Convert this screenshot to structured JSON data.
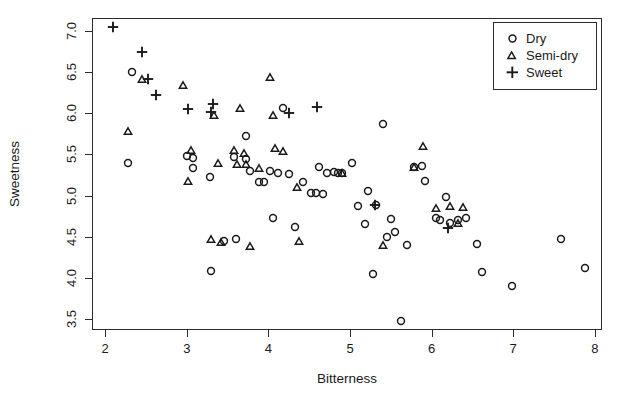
{
  "chart_data": {
    "type": "scatter",
    "title": "",
    "xlabel": "Bitterness",
    "ylabel": "Sweetness",
    "xlim": [
      1.85,
      8.1
    ],
    "ylim": [
      3.35,
      7.15
    ],
    "xticks": [
      2,
      3,
      4,
      5,
      6,
      7,
      8
    ],
    "xtick_labels": [
      "2",
      "3",
      "4",
      "5",
      "6",
      "7",
      "8"
    ],
    "yticks": [
      3.5,
      4.0,
      4.5,
      5.0,
      5.5,
      6.0,
      6.5,
      7.0
    ],
    "ytick_labels": [
      "3.5",
      "4.0",
      "4.5",
      "5.0",
      "5.5",
      "6.0",
      "6.5",
      "7.0"
    ],
    "grid": false,
    "legend_position": "top-right",
    "marker_color": "#1a1a1a",
    "series": [
      {
        "name": "Dry",
        "marker": "circle",
        "points": [
          [
            2.33,
            6.5
          ],
          [
            2.28,
            5.4
          ],
          [
            3.0,
            5.48
          ],
          [
            3.08,
            5.46
          ],
          [
            3.08,
            5.33
          ],
          [
            3.28,
            5.23
          ],
          [
            3.3,
            4.08
          ],
          [
            3.58,
            5.47
          ],
          [
            3.72,
            5.73
          ],
          [
            3.72,
            5.44
          ],
          [
            3.78,
            5.3
          ],
          [
            3.88,
            5.17
          ],
          [
            3.95,
            5.17
          ],
          [
            4.02,
            5.3
          ],
          [
            4.05,
            4.73
          ],
          [
            4.12,
            5.28
          ],
          [
            4.18,
            6.07
          ],
          [
            4.25,
            5.26
          ],
          [
            4.33,
            4.62
          ],
          [
            4.42,
            5.17
          ],
          [
            4.52,
            5.03
          ],
          [
            4.58,
            5.03
          ],
          [
            4.62,
            5.35
          ],
          [
            4.67,
            5.02
          ],
          [
            4.72,
            5.28
          ],
          [
            4.8,
            5.29
          ],
          [
            4.85,
            5.28
          ],
          [
            4.9,
            5.27
          ],
          [
            5.02,
            5.4
          ],
          [
            5.1,
            4.87
          ],
          [
            5.18,
            4.65
          ],
          [
            5.22,
            5.05
          ],
          [
            5.28,
            4.04
          ],
          [
            5.32,
            4.88
          ],
          [
            5.4,
            5.87
          ],
          [
            5.45,
            4.5
          ],
          [
            5.5,
            4.72
          ],
          [
            5.55,
            4.56
          ],
          [
            5.62,
            3.47
          ],
          [
            5.7,
            4.4
          ],
          [
            5.78,
            5.35
          ],
          [
            5.88,
            5.36
          ],
          [
            5.92,
            5.18
          ],
          [
            6.05,
            4.73
          ],
          [
            6.1,
            4.7
          ],
          [
            6.17,
            4.98
          ],
          [
            6.22,
            4.67
          ],
          [
            6.32,
            4.7
          ],
          [
            6.42,
            4.73
          ],
          [
            6.55,
            4.41
          ],
          [
            6.62,
            4.07
          ],
          [
            6.98,
            3.9
          ],
          [
            7.58,
            4.47
          ],
          [
            7.88,
            4.12
          ],
          [
            3.45,
            4.45
          ],
          [
            3.6,
            4.47
          ]
        ]
      },
      {
        "name": "Semi-dry",
        "marker": "triangle",
        "points": [
          [
            2.45,
            6.42
          ],
          [
            2.28,
            5.79
          ],
          [
            2.95,
            6.35
          ],
          [
            3.02,
            5.18
          ],
          [
            3.05,
            5.55
          ],
          [
            3.3,
            4.47
          ],
          [
            3.33,
            5.98
          ],
          [
            3.38,
            5.4
          ],
          [
            3.42,
            4.44
          ],
          [
            3.58,
            5.55
          ],
          [
            3.62,
            5.38
          ],
          [
            3.65,
            6.07
          ],
          [
            3.7,
            5.52
          ],
          [
            3.72,
            5.38
          ],
          [
            3.78,
            4.38
          ],
          [
            3.88,
            5.33
          ],
          [
            4.02,
            6.44
          ],
          [
            4.05,
            5.98
          ],
          [
            4.08,
            5.58
          ],
          [
            4.18,
            5.54
          ],
          [
            4.35,
            5.1
          ],
          [
            4.38,
            4.45
          ],
          [
            4.9,
            5.28
          ],
          [
            5.4,
            4.4
          ],
          [
            5.9,
            5.6
          ],
          [
            6.05,
            4.85
          ],
          [
            6.22,
            4.87
          ],
          [
            6.38,
            4.86
          ],
          [
            6.32,
            4.66
          ],
          [
            5.78,
            5.35
          ]
        ]
      },
      {
        "name": "Sweet",
        "marker": "plus",
        "points": [
          [
            2.1,
            7.05
          ],
          [
            2.45,
            6.75
          ],
          [
            2.52,
            6.42
          ],
          [
            2.62,
            6.22
          ],
          [
            3.02,
            6.05
          ],
          [
            3.3,
            6.02
          ],
          [
            3.32,
            6.12
          ],
          [
            4.25,
            6.0
          ],
          [
            4.6,
            6.08
          ],
          [
            5.3,
            4.88
          ],
          [
            6.2,
            4.6
          ]
        ]
      }
    ]
  },
  "legend": {
    "items": [
      {
        "label": "Dry",
        "marker": "circle"
      },
      {
        "label": "Semi-dry",
        "marker": "triangle"
      },
      {
        "label": "Sweet",
        "marker": "plus"
      }
    ]
  }
}
